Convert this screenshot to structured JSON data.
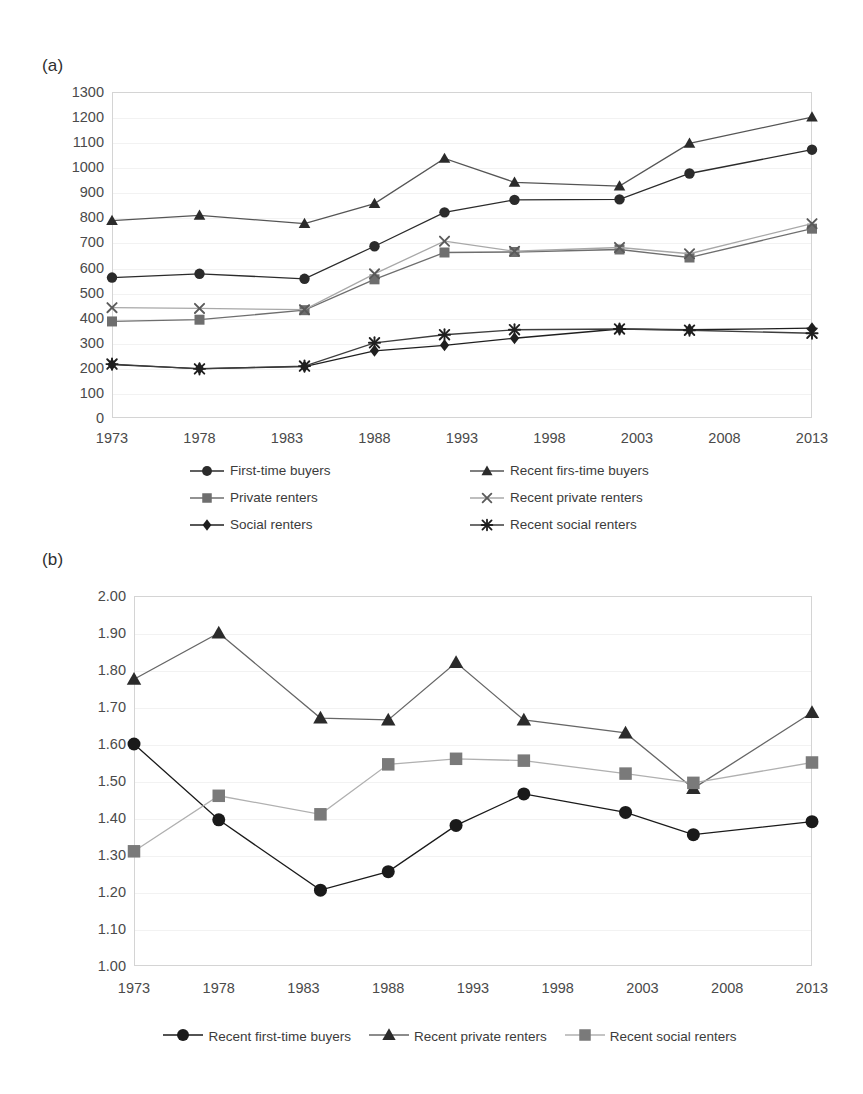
{
  "panels": {
    "a": {
      "label": "(a)"
    },
    "b": {
      "label": "(b)"
    }
  },
  "chart_data": [
    {
      "panel": "(a)",
      "type": "line",
      "title": "",
      "xlabel": "",
      "ylabel": "",
      "x": [
        1973,
        1978,
        1984,
        1988,
        1992,
        1996,
        2002,
        2006,
        2013
      ],
      "xtick_labels": [
        "1973",
        "1978",
        "1983",
        "1988",
        "1993",
        "1998",
        "2003",
        "2008",
        "2013"
      ],
      "xtick_values": [
        1973,
        1978,
        1983,
        1988,
        1993,
        1998,
        2003,
        2008,
        2013
      ],
      "ytick_labels": [
        "0",
        "100",
        "200",
        "300",
        "400",
        "500",
        "600",
        "700",
        "800",
        "900",
        "1000",
        "1100",
        "1200",
        "1300"
      ],
      "ytick_values": [
        0,
        100,
        200,
        300,
        400,
        500,
        600,
        700,
        800,
        900,
        1000,
        1100,
        1200,
        1300
      ],
      "xlim": [
        1973,
        2013
      ],
      "ylim": [
        0,
        1300
      ],
      "grid": true,
      "legend_position": "bottom",
      "series": [
        {
          "name": "First-time buyers",
          "marker": "circle",
          "color": "#2b2b2b",
          "line_color": "#2b2b2b",
          "values": [
            560,
            575,
            555,
            685,
            820,
            870,
            872,
            975,
            1070
          ]
        },
        {
          "name": "Recent firs-time buyers",
          "marker": "triangle",
          "color": "#2b2b2b",
          "line_color": "#555555",
          "values": [
            787,
            808,
            775,
            855,
            1035,
            940,
            925,
            1095,
            1200
          ]
        },
        {
          "name": "Private renters",
          "marker": "square",
          "color": "#6e6e6e",
          "line_color": "#6e6e6e",
          "values": [
            385,
            392,
            430,
            553,
            660,
            662,
            672,
            640,
            755
          ]
        },
        {
          "name": "Recent private renters",
          "marker": "x",
          "color": "#5a5a5a",
          "line_color": "#a8a8a8",
          "values": [
            440,
            437,
            432,
            575,
            705,
            665,
            680,
            655,
            775
          ]
        },
        {
          "name": "Social renters",
          "marker": "diamond",
          "color": "#1f1f1f",
          "line_color": "#1f1f1f",
          "values": [
            213,
            197,
            205,
            268,
            290,
            318,
            355,
            352,
            358
          ]
        },
        {
          "name": "Recent social renters",
          "marker": "star",
          "color": "#1f1f1f",
          "line_color": "#3d3d3d",
          "values": [
            215,
            196,
            207,
            300,
            332,
            352,
            355,
            350,
            338
          ]
        }
      ]
    },
    {
      "panel": "(b)",
      "type": "line",
      "title": "",
      "xlabel": "",
      "ylabel": "",
      "x": [
        1973,
        1978,
        1984,
        1988,
        1992,
        1996,
        2002,
        2006,
        2013
      ],
      "xtick_labels": [
        "1973",
        "1978",
        "1983",
        "1988",
        "1993",
        "1998",
        "2003",
        "2008",
        "2013"
      ],
      "xtick_values": [
        1973,
        1978,
        1983,
        1988,
        1993,
        1998,
        2003,
        2008,
        2013
      ],
      "ytick_labels": [
        "1.00",
        "1.10",
        "1.20",
        "1.30",
        "1.40",
        "1.50",
        "1.60",
        "1.70",
        "1.80",
        "1.90",
        "2.00"
      ],
      "ytick_values": [
        1.0,
        1.1,
        1.2,
        1.3,
        1.4,
        1.5,
        1.6,
        1.7,
        1.8,
        1.9,
        2.0
      ],
      "xlim": [
        1973,
        2013
      ],
      "ylim": [
        1.0,
        2.0
      ],
      "grid": true,
      "legend_position": "bottom",
      "series": [
        {
          "name": "Recent first-time buyers",
          "marker": "circle",
          "color": "#1a1a1a",
          "line_color": "#1a1a1a",
          "values": [
            1.6,
            1.395,
            1.205,
            1.255,
            1.38,
            1.465,
            1.415,
            1.355,
            1.39
          ]
        },
        {
          "name": "Recent private renters",
          "marker": "triangle",
          "color": "#2b2b2b",
          "line_color": "#666666",
          "values": [
            1.775,
            1.9,
            1.67,
            1.665,
            1.82,
            1.665,
            1.63,
            1.48,
            1.685
          ]
        },
        {
          "name": "Recent social renters",
          "marker": "square",
          "color": "#7a7a7a",
          "line_color": "#b0b0b0",
          "values": [
            1.31,
            1.46,
            1.41,
            1.545,
            1.56,
            1.555,
            1.52,
            1.495,
            1.55
          ]
        }
      ]
    }
  ]
}
